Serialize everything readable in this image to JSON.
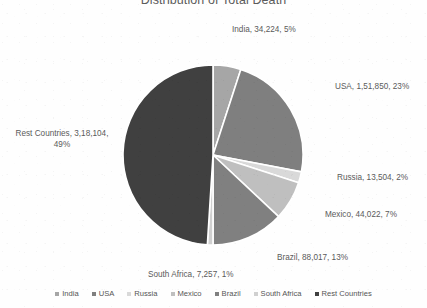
{
  "chart_data": {
    "type": "pie",
    "title": "Distribution of Total Death",
    "categories": [
      "India",
      "USA",
      "Russia",
      "Mexico",
      "Brazil",
      "South Africa",
      "Rest Countries"
    ],
    "values": [
      34224,
      151850,
      13504,
      44022,
      88017,
      7257,
      318104
    ],
    "percentages": [
      5,
      23,
      2,
      7,
      13,
      1,
      49
    ],
    "value_labels": [
      "34,224",
      "1,51,850",
      "13,504",
      "44,022",
      "88,017",
      "7,257",
      "3,18,104"
    ],
    "colors": [
      "#a6a6a6",
      "#7f7f7f",
      "#d9d9d9",
      "#bfbfbf",
      "#808080",
      "#d0d0d0",
      "#404040"
    ],
    "start_angle_deg": 0,
    "direction": "clockwise",
    "slice_border_color": "#ffffff",
    "legend_position": "bottom",
    "grid": false,
    "data_labels": [
      "India, 34,224, 5%",
      "USA, 1,51,850, 23%",
      "Russia, 13,504, 2%",
      "Mexico, 44,022, 7%",
      "Brazil, 88,017, 13%",
      "South Africa, 7,257, 1%",
      "Rest Countries, 3,18,104, 49%"
    ]
  },
  "title": "Distribution of Total Death",
  "labels": {
    "india": "India, 34,224, 5%",
    "usa": "USA, 1,51,850, 23%",
    "russia": "Russia, 13,504, 2%",
    "mexico": "Mexico, 44,022, 7%",
    "brazil": "Brazil, 88,017, 13%",
    "south_africa": "South Africa, 7,257, 1%",
    "rest_countries": "Rest Countries, 3,18,104, 49%"
  },
  "legend": {
    "items": [
      {
        "label": "India",
        "color": "#a6a6a6"
      },
      {
        "label": "USA",
        "color": "#7f7f7f"
      },
      {
        "label": "Russia",
        "color": "#d9d9d9"
      },
      {
        "label": "Mexico",
        "color": "#bfbfbf"
      },
      {
        "label": "Brazil",
        "color": "#808080"
      },
      {
        "label": "South Africa",
        "color": "#d0d0d0"
      },
      {
        "label": "Rest Countries",
        "color": "#404040"
      }
    ]
  }
}
